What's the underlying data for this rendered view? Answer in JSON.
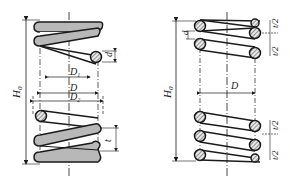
{
  "left_figure": {
    "title": "compression spring with ground ends (contour view)",
    "labels": {
      "free_height": "H",
      "free_height_sub": "0",
      "wire_diameter": "d",
      "inner_diameter": "D",
      "inner_diameter_sub": "1",
      "mean_diameter": "D",
      "outer_diameter": "D",
      "outer_diameter_sub": "2",
      "pitch": "t"
    }
  },
  "right_figure": {
    "title": "compression spring (section view)",
    "labels": {
      "free_height": "H",
      "free_height_sub": "0",
      "wire_diameter": "d",
      "mean_diameter": "D",
      "half_pitch_1": "t/2",
      "half_pitch_2": "t/2",
      "half_pitch_3": "t/2",
      "half_pitch_4": "t/2"
    }
  },
  "colors": {
    "line": "#1a1a1a",
    "coil_fill": "#b8b8b8",
    "hatch": "#555555"
  }
}
